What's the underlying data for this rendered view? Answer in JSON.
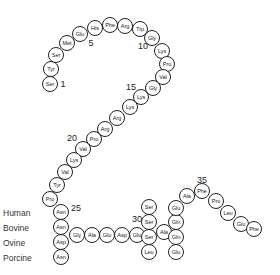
{
  "diagram": {
    "residues": [
      {
        "n": 1,
        "label": "Ser",
        "x": 50,
        "y": 84
      },
      {
        "n": 2,
        "label": "Tyr",
        "x": 51,
        "y": 69
      },
      {
        "n": 3,
        "label": "Ser",
        "x": 56,
        "y": 55
      },
      {
        "n": 4,
        "label": "Met",
        "x": 67,
        "y": 43
      },
      {
        "n": 5,
        "label": "Glu",
        "x": 80,
        "y": 34
      },
      {
        "n": 6,
        "label": "His",
        "x": 95,
        "y": 28
      },
      {
        "n": 7,
        "label": "Phe",
        "x": 110,
        "y": 25
      },
      {
        "n": 8,
        "label": "Arg",
        "x": 125,
        "y": 26
      },
      {
        "n": 9,
        "label": "Trp",
        "x": 140,
        "y": 29
      },
      {
        "n": 10,
        "label": "Gly",
        "x": 152,
        "y": 38
      },
      {
        "n": 11,
        "label": "Lys",
        "x": 162,
        "y": 51
      },
      {
        "n": 12,
        "label": "Pro",
        "x": 167,
        "y": 64
      },
      {
        "n": 13,
        "label": "Val",
        "x": 163,
        "y": 77
      },
      {
        "n": 14,
        "label": "Gly",
        "x": 153,
        "y": 88
      },
      {
        "n": 15,
        "label": "Lys",
        "x": 141,
        "y": 97
      },
      {
        "n": 16,
        "label": "Lys",
        "x": 130,
        "y": 107
      },
      {
        "n": 17,
        "label": "Arg",
        "x": 117,
        "y": 118
      },
      {
        "n": 18,
        "label": "Arg",
        "x": 105,
        "y": 129
      },
      {
        "n": 19,
        "label": "Pro",
        "x": 94,
        "y": 139
      },
      {
        "n": 20,
        "label": "Val",
        "x": 83,
        "y": 149
      },
      {
        "n": 21,
        "label": "Lys",
        "x": 74,
        "y": 160
      },
      {
        "n": 22,
        "label": "Val",
        "x": 65,
        "y": 172
      },
      {
        "n": 23,
        "label": "Tyr",
        "x": 57,
        "y": 185
      },
      {
        "n": 24,
        "label": "Pro",
        "x": 50,
        "y": 199
      },
      {
        "n": 25,
        "label": "Asn",
        "x": 61,
        "y": 212
      },
      {
        "n": 26,
        "label": "Gly",
        "x": 77,
        "y": 235
      },
      {
        "n": 27,
        "label": "Ala",
        "x": 92,
        "y": 235
      },
      {
        "n": 28,
        "label": "Glu",
        "x": 107,
        "y": 235
      },
      {
        "n": 29,
        "label": "Asp",
        "x": 122,
        "y": 235
      },
      {
        "n": 30,
        "label": "Glu",
        "x": 137,
        "y": 235
      },
      {
        "n": 31,
        "label": "Ser",
        "x": 149,
        "y": 222
      },
      {
        "n": 32,
        "label": "Ala",
        "x": 164,
        "y": 232
      },
      {
        "n": 33,
        "label": "Gln",
        "x": 176,
        "y": 222
      },
      {
        "n": 34,
        "label": "Ala",
        "x": 187,
        "y": 196
      },
      {
        "n": 35,
        "label": "Phe",
        "x": 202,
        "y": 191
      },
      {
        "n": 36,
        "label": "Pro",
        "x": 216,
        "y": 201
      },
      {
        "n": 37,
        "label": "Leu",
        "x": 228,
        "y": 213
      },
      {
        "n": 38,
        "label": "Glu",
        "x": 241,
        "y": 224
      },
      {
        "n": 39,
        "label": "Phe",
        "x": 254,
        "y": 229
      }
    ],
    "variants": [
      {
        "pos": 25,
        "label": "Asn",
        "x": 61,
        "y": 227
      },
      {
        "pos": 25,
        "label": "Asp",
        "x": 61,
        "y": 242
      },
      {
        "pos": 25,
        "label": "Asn",
        "x": 61,
        "y": 257
      },
      {
        "pos": 31,
        "label": "Ser",
        "x": 149,
        "y": 207
      },
      {
        "pos": 31,
        "label": "Ser",
        "x": 149,
        "y": 237
      },
      {
        "pos": 31,
        "label": "Leu",
        "x": 149,
        "y": 252
      },
      {
        "pos": 33,
        "label": "Glu",
        "x": 176,
        "y": 208
      },
      {
        "pos": 33,
        "label": "Gln",
        "x": 176,
        "y": 237
      },
      {
        "pos": 33,
        "label": "Glu",
        "x": 176,
        "y": 252
      }
    ],
    "position_labels": [
      {
        "text": "1",
        "x": 63,
        "y": 84
      },
      {
        "text": "5",
        "x": 91,
        "y": 43
      },
      {
        "text": "10",
        "x": 143,
        "y": 46
      },
      {
        "text": "15",
        "x": 131,
        "y": 87
      },
      {
        "text": "20",
        "x": 72,
        "y": 138
      },
      {
        "text": "25",
        "x": 76,
        "y": 208
      },
      {
        "text": "30",
        "x": 137,
        "y": 219
      },
      {
        "text": "35",
        "x": 202,
        "y": 180
      }
    ],
    "species": [
      {
        "label": "Human",
        "y": 213
      },
      {
        "label": "Bovine",
        "y": 228
      },
      {
        "label": "Ovine",
        "y": 243
      },
      {
        "label": "Porcine",
        "y": 258
      }
    ]
  }
}
